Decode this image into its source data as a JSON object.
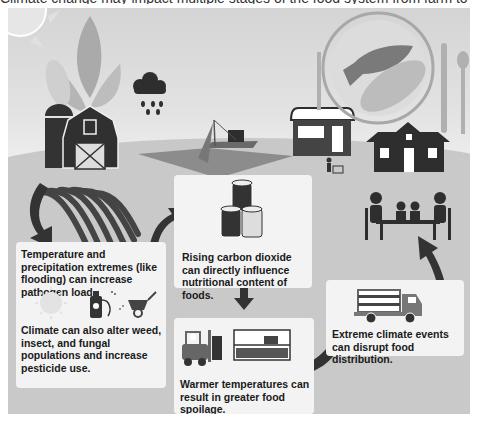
{
  "caption": "Climate change may impact multiple stages of the food system from farm to table, including food safety",
  "stages": [
    {
      "id": "farm",
      "icons": [
        "sun-icon",
        "corn-icon",
        "silo-icon",
        "barn-icon",
        "corn-rows-icon"
      ]
    },
    {
      "id": "weather",
      "icons": [
        "rain-cloud-icon"
      ]
    },
    {
      "id": "fishing",
      "icons": [
        "fishing-boat-icon",
        "net-icon"
      ]
    },
    {
      "id": "market",
      "icons": [
        "store-icon",
        "shopper-cart-icon"
      ]
    },
    {
      "id": "table",
      "icons": [
        "plate-icon",
        "fish-icon",
        "corn-icon",
        "fork-icon",
        "knife-icon",
        "spoon-icon",
        "house-icon",
        "family-dining-icon"
      ]
    }
  ],
  "boxes": {
    "pathogen": {
      "text1": "Temperature and precipitation extremes (like flooding) can increase pathogen load.",
      "text2": "Climate can also alter weed, insect, and fungal populations and increase pesticide use.",
      "icons": [
        "sun-icon",
        "pesticide-sprayer-icon",
        "wheelbarrow-icon"
      ]
    },
    "co2": {
      "text": "Rising carbon dioxide can directly influence nutritional content of foods.",
      "icons": [
        "canned-food-icon"
      ]
    },
    "spoilage": {
      "text": "Warmer temperatures can result in greater food spoilage.",
      "icons": [
        "forklift-icon",
        "warehouse-shelf-icon"
      ]
    },
    "distribution": {
      "text": "Extreme climate events can disrupt food distribution.",
      "icons": [
        "delivery-truck-icon"
      ]
    }
  },
  "colors": {
    "dark": "#2e2e2e",
    "mid": "#8a8a8a",
    "light": "#f3f3f3",
    "bg": "#c9c9c9"
  }
}
